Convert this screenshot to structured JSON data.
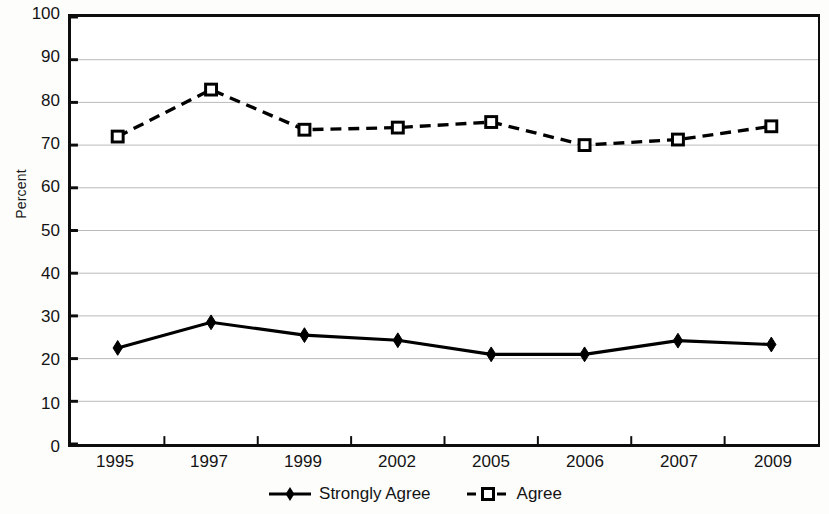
{
  "chart_data": {
    "type": "line",
    "title": "",
    "xlabel": "",
    "ylabel": "Percent",
    "categories": [
      "1995",
      "1997",
      "1999",
      "2002",
      "2005",
      "2006",
      "2007",
      "2009"
    ],
    "ylim": [
      0,
      100
    ],
    "y_ticks": [
      "100",
      "90",
      "80",
      "70",
      "60",
      "50",
      "40",
      "30",
      "20",
      "10",
      "0"
    ],
    "grid": "horizontal",
    "legend_position": "bottom",
    "series": [
      {
        "name": "Strongly Agree",
        "marker": "filled-diamond",
        "line_style": "solid",
        "color": "#000000",
        "values": [
          22.5,
          28.5,
          25.5,
          24.3,
          21.0,
          21.0,
          24.2,
          23.3
        ]
      },
      {
        "name": "Agree",
        "marker": "open-square",
        "line_style": "dashed",
        "color": "#000000",
        "values": [
          72.0,
          83.0,
          73.6,
          74.1,
          75.4,
          70.0,
          71.3,
          74.4
        ]
      }
    ]
  },
  "legend": {
    "items": [
      {
        "label": "Strongly Agree"
      },
      {
        "label": "Agree"
      }
    ]
  }
}
